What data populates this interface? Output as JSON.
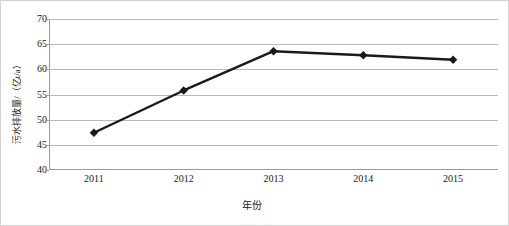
{
  "chart_data": {
    "type": "line",
    "title": "",
    "xlabel": "年份",
    "ylabel": "污水排放量/（亿t/a）",
    "categories": [
      "2011",
      "2012",
      "2013",
      "2014",
      "2015"
    ],
    "values": [
      47.4,
      55.8,
      63.6,
      62.8,
      61.9
    ],
    "series": [
      {
        "name": "污水排放量",
        "values": [
          47.4,
          55.8,
          63.6,
          62.8,
          61.9
        ]
      }
    ],
    "ylim": [
      40,
      70
    ],
    "yticks": [
      40,
      45,
      50,
      55,
      60,
      65,
      70
    ],
    "ytick_labels": [
      "40",
      "45",
      "50",
      "55",
      "60",
      "65",
      "70"
    ],
    "xtick_labels": [
      "2011",
      "2012",
      "2013",
      "2014",
      "2015"
    ],
    "grid": "horizontal",
    "legend": "none",
    "marker": "diamond",
    "colors": {
      "line": "#1a1a1a",
      "marker": "#1a1a1a",
      "gridline": "#b9b9b9",
      "axis": "#9a9a9a",
      "border": "#d2d2d2",
      "text": "#1a1a1a",
      "background": "#ffffff"
    }
  }
}
